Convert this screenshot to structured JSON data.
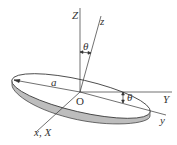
{
  "diagram": {
    "labels": {
      "Z": "Z",
      "z": "z",
      "theta_top": "θ",
      "a": "a",
      "origin": "O",
      "Y": "Y",
      "theta_right": "θ",
      "y": "y",
      "xX": "x, X"
    },
    "colors": {
      "line": "#333333",
      "disc_top": "#ffffff",
      "disc_edge": "#b8b8b8",
      "disc_edge_dark": "#8a8a8a"
    }
  }
}
